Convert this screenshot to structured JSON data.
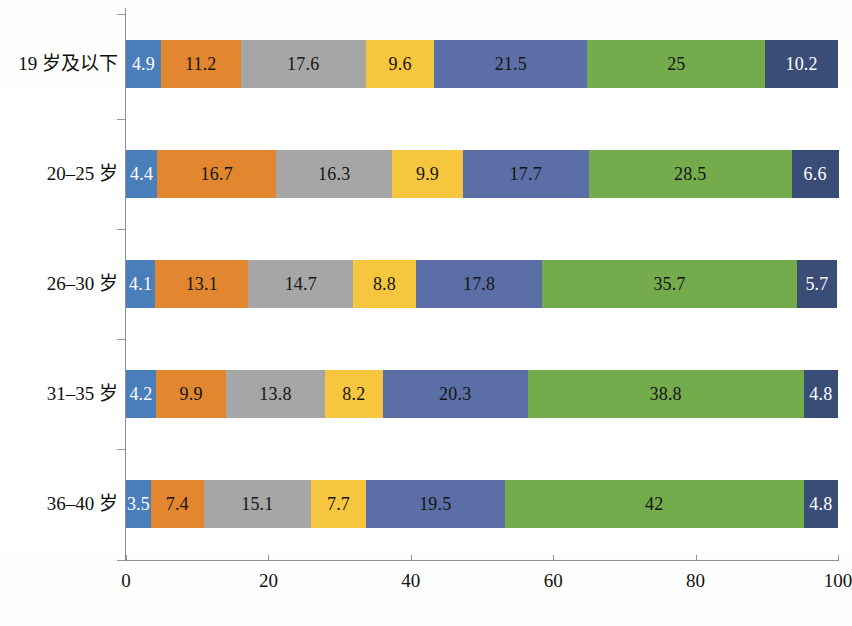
{
  "chart_data": {
    "type": "bar",
    "orientation": "horizontal",
    "stacked": true,
    "stack_mode": "percent",
    "title": "",
    "subtitle": "",
    "xlabel": "",
    "ylabel": "",
    "xlim": [
      0,
      100
    ],
    "xticks": [
      0,
      20,
      40,
      60,
      80,
      100
    ],
    "xtick_labels": [
      "0",
      "20",
      "40",
      "60",
      "80",
      "100"
    ],
    "grid": false,
    "legend": "none",
    "categories": [
      "19 岁及以下",
      "20–25 岁",
      "26–30 岁",
      "31–35 岁",
      "36–40 岁"
    ],
    "series": [
      {
        "name": "series-1",
        "color": "#4a7ebb",
        "label_color": "light",
        "values": [
          4.9,
          4.4,
          4.1,
          4.2,
          3.5
        ]
      },
      {
        "name": "series-2",
        "color": "#e2862f",
        "label_color": "dark",
        "values": [
          11.2,
          16.7,
          13.1,
          9.9,
          7.4
        ]
      },
      {
        "name": "series-3",
        "color": "#a6a6a6",
        "label_color": "dark",
        "values": [
          17.6,
          16.3,
          14.7,
          13.8,
          15.1
        ]
      },
      {
        "name": "series-4",
        "color": "#f7c githubError",
        "label_color": "dark",
        "values": [
          9.6,
          9.9,
          8.8,
          8.2,
          7.7
        ]
      },
      {
        "name": "series-5",
        "color": "#5b6ea6",
        "label_color": "dark",
        "values": [
          21.5,
          17.7,
          17.8,
          20.3,
          19.5
        ]
      },
      {
        "name": "series-6",
        "color": "#74ab4c",
        "label_color": "dark",
        "values": [
          25,
          28.5,
          35.7,
          38.8,
          42
        ]
      },
      {
        "name": "series-7",
        "color": "#3a4d76",
        "label_color": "light",
        "values": [
          10.2,
          6.6,
          5.7,
          4.8,
          4.8
        ]
      }
    ],
    "value_labels": [
      [
        "4.9",
        "11.2",
        "17.6",
        "9.6",
        "21.5",
        "25",
        "10.2"
      ],
      [
        "4.4",
        "16.7",
        "16.3",
        "9.9",
        "17.7",
        "28.5",
        "6.6"
      ],
      [
        "4.1",
        "13.1",
        "14.7",
        "8.8",
        "17.8",
        "35.7",
        "5.7"
      ],
      [
        "4.2",
        "9.9",
        "13.8",
        "8.2",
        "20.3",
        "38.8",
        "4.8"
      ],
      [
        "3.5",
        "7.4",
        "15.1",
        "7.7",
        "19.5",
        "42",
        "4.8"
      ]
    ],
    "colors": {
      "series_1": "#4a7ebb",
      "series_2": "#e2862f",
      "series_3": "#a6a6a6",
      "series_4": "#f7c63f",
      "series_5": "#5b6ea6",
      "series_6": "#74ab4c",
      "series_7": "#3a4d76",
      "axis": "#8f8f8f",
      "text": "#101010",
      "background": "#ffffff"
    }
  }
}
